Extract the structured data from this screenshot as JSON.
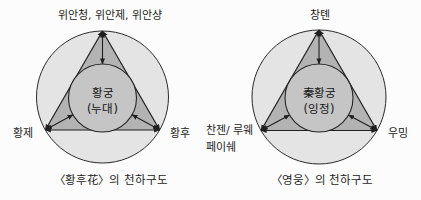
{
  "figure": {
    "background": "#fcfcfc"
  },
  "colors": {
    "outer_circle": "#e4e4e4",
    "triangle": "#b3b3b3",
    "inner_circle": "#c5c5c5",
    "line": "#1f1f1f"
  },
  "diagrams": [
    {
      "top_label": "위안청, 위안제, 위안샹",
      "left_label": "황제",
      "right_label": "황후",
      "center_line1": "황궁",
      "center_line2": "(누대)",
      "caption": "〈황후花〉의 천하구도"
    },
    {
      "top_label": "창톈",
      "left_label_line1": "찬젠/ 루웨",
      "left_label_line2": "페이쉐",
      "right_label": "우밍",
      "center_line1": "秦황궁",
      "center_line2": "(잉정)",
      "caption": "〈영웅〉의 천하구도"
    }
  ]
}
